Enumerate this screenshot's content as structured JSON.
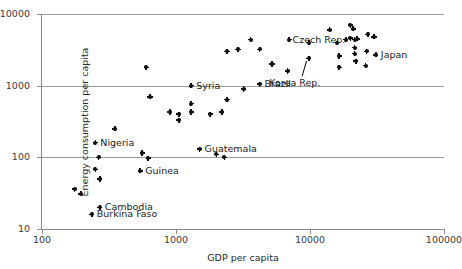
{
  "chart_data": {
    "type": "scatter",
    "title": "",
    "xlabel": "GDP per capita",
    "ylabel": "Energy consumption per capita",
    "xscale": "log",
    "yscale": "log",
    "xlim": [
      100,
      100000
    ],
    "ylim": [
      10,
      10000
    ],
    "xticks": [
      "100",
      "1000",
      "10000",
      "100000"
    ],
    "xtick_values": [
      100,
      1000,
      10000,
      100000
    ],
    "yticks": [
      "10",
      "100",
      "1000",
      "10000"
    ],
    "ytick_values": [
      10,
      100,
      1000,
      10000
    ],
    "grid": "horizontal gridlines at 100, 1000, 10000",
    "legend": "none",
    "points": [
      {
        "x": 175,
        "y": 36,
        "label": ""
      },
      {
        "x": 195,
        "y": 31,
        "label": ""
      },
      {
        "x": 250,
        "y": 68,
        "label": ""
      },
      {
        "x": 270,
        "y": 50,
        "label": ""
      },
      {
        "x": 265,
        "y": 100,
        "label": ""
      },
      {
        "x": 250,
        "y": 160,
        "label": "Nigeria"
      },
      {
        "x": 270,
        "y": 20,
        "label": "Cambodia"
      },
      {
        "x": 235,
        "y": 16,
        "label": "Burkina Faso"
      },
      {
        "x": 350,
        "y": 250,
        "label": ""
      },
      {
        "x": 560,
        "y": 115,
        "label": ""
      },
      {
        "x": 620,
        "y": 97,
        "label": ""
      },
      {
        "x": 540,
        "y": 65,
        "label": "Guinea"
      },
      {
        "x": 640,
        "y": 700,
        "label": ""
      },
      {
        "x": 600,
        "y": 1800,
        "label": ""
      },
      {
        "x": 900,
        "y": 430,
        "label": ""
      },
      {
        "x": 1050,
        "y": 400,
        "label": ""
      },
      {
        "x": 1050,
        "y": 330,
        "label": ""
      },
      {
        "x": 1300,
        "y": 560,
        "label": ""
      },
      {
        "x": 1300,
        "y": 430,
        "label": ""
      },
      {
        "x": 1300,
        "y": 1000,
        "label": "Syria"
      },
      {
        "x": 1500,
        "y": 130,
        "label": "Guatemala"
      },
      {
        "x": 1800,
        "y": 400,
        "label": ""
      },
      {
        "x": 2200,
        "y": 430,
        "label": ""
      },
      {
        "x": 2400,
        "y": 640,
        "label": ""
      },
      {
        "x": 2400,
        "y": 3000,
        "label": ""
      },
      {
        "x": 2900,
        "y": 3200,
        "label": ""
      },
      {
        "x": 2000,
        "y": 110,
        "label": ""
      },
      {
        "x": 2300,
        "y": 100,
        "label": ""
      },
      {
        "x": 3200,
        "y": 900,
        "label": ""
      },
      {
        "x": 4200,
        "y": 1050,
        "label": "Brazil"
      },
      {
        "x": 3600,
        "y": 4400,
        "label": ""
      },
      {
        "x": 4200,
        "y": 3200,
        "label": ""
      },
      {
        "x": 5200,
        "y": 2000,
        "label": ""
      },
      {
        "x": 6800,
        "y": 1600,
        "label": ""
      },
      {
        "x": 7000,
        "y": 4400,
        "label": ""
      },
      {
        "x": 9800,
        "y": 4000,
        "label": ""
      },
      {
        "x": 9800,
        "y": 2400,
        "label": "Korea Rep."
      },
      {
        "x": 14000,
        "y": 6000,
        "label": ""
      },
      {
        "x": 16000,
        "y": 4000,
        "label": ""
      },
      {
        "x": 16500,
        "y": 2600,
        "label": ""
      },
      {
        "x": 16500,
        "y": 1800,
        "label": ""
      },
      {
        "x": 18500,
        "y": 4400,
        "label": ""
      },
      {
        "x": 20000,
        "y": 7000,
        "label": ""
      },
      {
        "x": 21000,
        "y": 6200,
        "label": ""
      },
      {
        "x": 20000,
        "y": 4600,
        "label": ""
      },
      {
        "x": 21500,
        "y": 4400,
        "label": ""
      },
      {
        "x": 22500,
        "y": 4500,
        "label": ""
      },
      {
        "x": 21500,
        "y": 3400,
        "label": ""
      },
      {
        "x": 21500,
        "y": 2800,
        "label": ""
      },
      {
        "x": 22000,
        "y": 2200,
        "label": ""
      },
      {
        "x": 27000,
        "y": 5200,
        "label": ""
      },
      {
        "x": 26500,
        "y": 3000,
        "label": ""
      },
      {
        "x": 26000,
        "y": 1900,
        "label": ""
      },
      {
        "x": 31000,
        "y": 2700,
        "label": "Japan"
      },
      {
        "x": 30000,
        "y": 4800,
        "label": ""
      }
    ],
    "annotations": [
      {
        "text": "Czech Rep.",
        "x": 6800,
        "y": 4400,
        "placement": "right"
      },
      {
        "text": "Korea Rep.",
        "x": 9800,
        "y": 2400,
        "placement": "leader-below"
      },
      {
        "text": "Japan",
        "x": 31000,
        "y": 2700,
        "placement": "right"
      },
      {
        "text": "Brazil",
        "x": 4200,
        "y": 1050,
        "placement": "right"
      },
      {
        "text": "Syria",
        "x": 1300,
        "y": 1000,
        "placement": "right"
      },
      {
        "text": "Guatemala",
        "x": 1500,
        "y": 130,
        "placement": "right"
      },
      {
        "text": "Nigeria",
        "x": 250,
        "y": 160,
        "placement": "right"
      },
      {
        "text": "Guinea",
        "x": 540,
        "y": 65,
        "placement": "right"
      },
      {
        "text": "Cambodia",
        "x": 270,
        "y": 20,
        "placement": "right"
      },
      {
        "text": "Burkina Faso",
        "x": 235,
        "y": 16,
        "placement": "right"
      }
    ],
    "colors": {
      "marker": "#111111",
      "gridline": "#9a9a9a",
      "axis": "#8a8a8a",
      "text": "#1a1a1a",
      "background": "#ffffff"
    }
  }
}
